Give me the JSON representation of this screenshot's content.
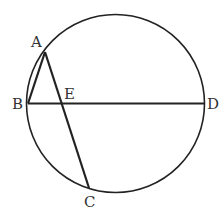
{
  "diagram": {
    "type": "circle-geometry",
    "stroke_color": "#222222",
    "circle": {
      "cx": 115.5,
      "cy": 103.5,
      "r": 89
    },
    "points": {
      "A": {
        "label": "A",
        "x": 45,
        "y": 52,
        "label_x": 31,
        "label_y": 47
      },
      "B": {
        "label": "B",
        "x": 28,
        "y": 103.5,
        "label_x": 12,
        "label_y": 109
      },
      "C": {
        "label": "C",
        "x": 89,
        "y": 188,
        "label_x": 84,
        "label_y": 207
      },
      "D": {
        "label": "D",
        "x": 204,
        "y": 103.5,
        "label_x": 207,
        "label_y": 109
      },
      "E": {
        "label": "E",
        "x": 62,
        "y": 103.5,
        "label_x": 64,
        "label_y": 99
      }
    },
    "segments": [
      {
        "name": "AB",
        "from": "A",
        "to": "B"
      },
      {
        "name": "AC",
        "from": "A",
        "to": "C"
      },
      {
        "name": "BD",
        "from": "B",
        "to": "D"
      }
    ]
  }
}
